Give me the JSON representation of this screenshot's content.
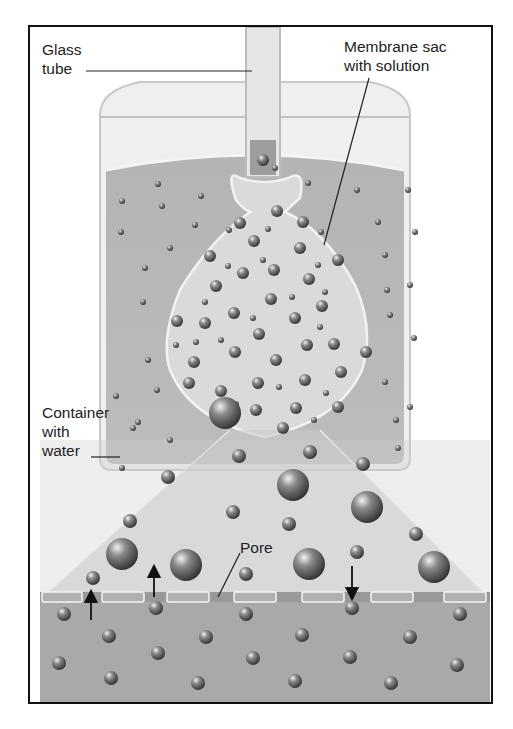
{
  "diagram": {
    "type": "osmosis-apparatus",
    "labels": {
      "glass_tube": "Glass\ntube",
      "membrane_sac": "Membrane sac\nwith solution",
      "container": "Container\nwith\nwater",
      "pore": "Pore"
    },
    "colors": {
      "frame": "#111111",
      "water": "#a9a9a9",
      "sac": "#dedede",
      "membrane_band": "#999999",
      "particle": "#6e6e6e",
      "label_text": "#222222"
    },
    "arrows": [
      {
        "position": "left",
        "direction": "up"
      },
      {
        "position": "center-left",
        "direction": "up"
      },
      {
        "position": "right",
        "direction": "down"
      }
    ]
  }
}
